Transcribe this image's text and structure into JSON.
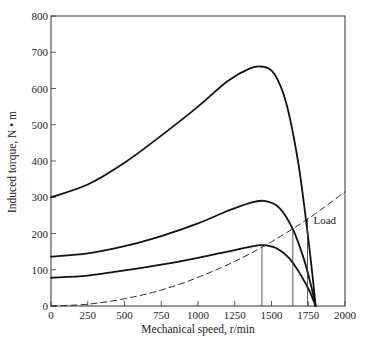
{
  "chart_data": {
    "type": "line",
    "title": "",
    "xlabel": "Mechanical speed, r/min",
    "ylabel": "Induced torque, N • m",
    "xlim": [
      0,
      2000
    ],
    "ylim": [
      0,
      800
    ],
    "xticks": [
      0,
      250,
      500,
      750,
      1000,
      1250,
      1500,
      1750,
      2000
    ],
    "yticks": [
      0,
      100,
      200,
      300,
      400,
      500,
      600,
      700,
      800
    ],
    "grid": false,
    "legend": null,
    "series": [
      {
        "name": "Torque-speed curve (highest)",
        "style": "solid",
        "x": [
          0,
          250,
          500,
          750,
          1000,
          1200,
          1350,
          1440,
          1520,
          1600,
          1680,
          1740,
          1780,
          1800
        ],
        "y": [
          300,
          335,
          395,
          470,
          550,
          620,
          655,
          660,
          640,
          560,
          400,
          220,
          80,
          0
        ]
      },
      {
        "name": "Torque-speed curve (middle)",
        "style": "solid",
        "x": [
          0,
          250,
          500,
          750,
          1000,
          1200,
          1350,
          1450,
          1550,
          1645,
          1720,
          1770,
          1800
        ],
        "y": [
          136,
          145,
          165,
          193,
          228,
          262,
          284,
          290,
          272,
          212,
          130,
          55,
          0
        ]
      },
      {
        "name": "Torque-speed curve (lowest)",
        "style": "solid",
        "x": [
          0,
          250,
          500,
          750,
          1000,
          1200,
          1350,
          1435,
          1530,
          1620,
          1700,
          1760,
          1800
        ],
        "y": [
          78,
          84,
          98,
          114,
          133,
          150,
          163,
          168,
          160,
          132,
          85,
          40,
          0
        ]
      },
      {
        "name": "Load",
        "style": "dashed",
        "x": [
          0,
          250,
          500,
          750,
          1000,
          1250,
          1435,
          1500,
          1645,
          1745,
          1800,
          2000
        ],
        "y": [
          0,
          5,
          20,
          44,
          79,
          123,
          162,
          177,
          213,
          240,
          255,
          315
        ]
      }
    ],
    "vertical_lines": [
      {
        "x": 1435,
        "y_top": 168
      },
      {
        "x": 1645,
        "y_top": 212
      },
      {
        "x": 1745,
        "y_top": 240
      }
    ],
    "annotations": [
      {
        "text": "Load",
        "x": 1840,
        "y": 238
      }
    ]
  }
}
